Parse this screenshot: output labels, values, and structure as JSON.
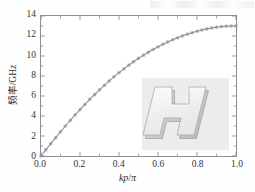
{
  "figure": {
    "background_color": "#ffffff",
    "frame_color": "#8d8d96"
  },
  "chart_data": {
    "type": "line",
    "title": "",
    "subtitle": "",
    "xlabel": "kp/π",
    "xlabel_parts": {
      "italic": "kp",
      "slash": "/",
      "pi": "π"
    },
    "ylabel": "频率/GHz",
    "xlim": [
      0.0,
      1.0
    ],
    "ylim": [
      0,
      14
    ],
    "xticks": [
      0.0,
      0.2,
      0.4,
      0.6,
      0.8,
      1.0
    ],
    "xtick_labels": [
      "0.0",
      "0.2",
      "0.4",
      "0.6",
      "0.8",
      "1.0"
    ],
    "yticks": [
      0,
      2,
      4,
      6,
      8,
      10,
      12,
      14
    ],
    "ytick_labels": [
      "0",
      "2",
      "4",
      "6",
      "8",
      "10",
      "12",
      "14"
    ],
    "grid": false,
    "legend": null,
    "minor_ticks": true,
    "series": [
      {
        "name": "dispersion",
        "line_color": "#9a8f9c",
        "marker": "star",
        "marker_color": "#9a8f9c",
        "x": [
          0.0,
          0.025,
          0.05,
          0.075,
          0.1,
          0.125,
          0.15,
          0.175,
          0.2,
          0.225,
          0.25,
          0.275,
          0.3,
          0.325,
          0.35,
          0.375,
          0.4,
          0.425,
          0.45,
          0.475,
          0.5,
          0.525,
          0.55,
          0.575,
          0.6,
          0.625,
          0.65,
          0.675,
          0.7,
          0.725,
          0.75,
          0.775,
          0.8,
          0.825,
          0.85,
          0.875,
          0.9,
          0.925,
          0.95,
          0.975,
          1.0
        ],
        "y": [
          0.0,
          0.62,
          1.23,
          1.83,
          2.42,
          3.0,
          3.56,
          4.11,
          4.64,
          5.16,
          5.66,
          6.15,
          6.62,
          7.07,
          7.51,
          7.93,
          8.33,
          8.71,
          9.08,
          9.43,
          9.76,
          10.07,
          10.37,
          10.65,
          10.92,
          11.17,
          11.4,
          11.62,
          11.82,
          12.01,
          12.18,
          12.33,
          12.47,
          12.6,
          12.71,
          12.8,
          12.88,
          12.94,
          12.98,
          13.0,
          13.0
        ]
      }
    ],
    "annotations": []
  },
  "inset": {
    "name": "H-shaped resonator structure",
    "description": "3D rendering of an H-shaped metallic unit cell",
    "background_color": "#ececed",
    "body_color": "#f3f3f3",
    "edge_color": "#a9a9ae"
  }
}
